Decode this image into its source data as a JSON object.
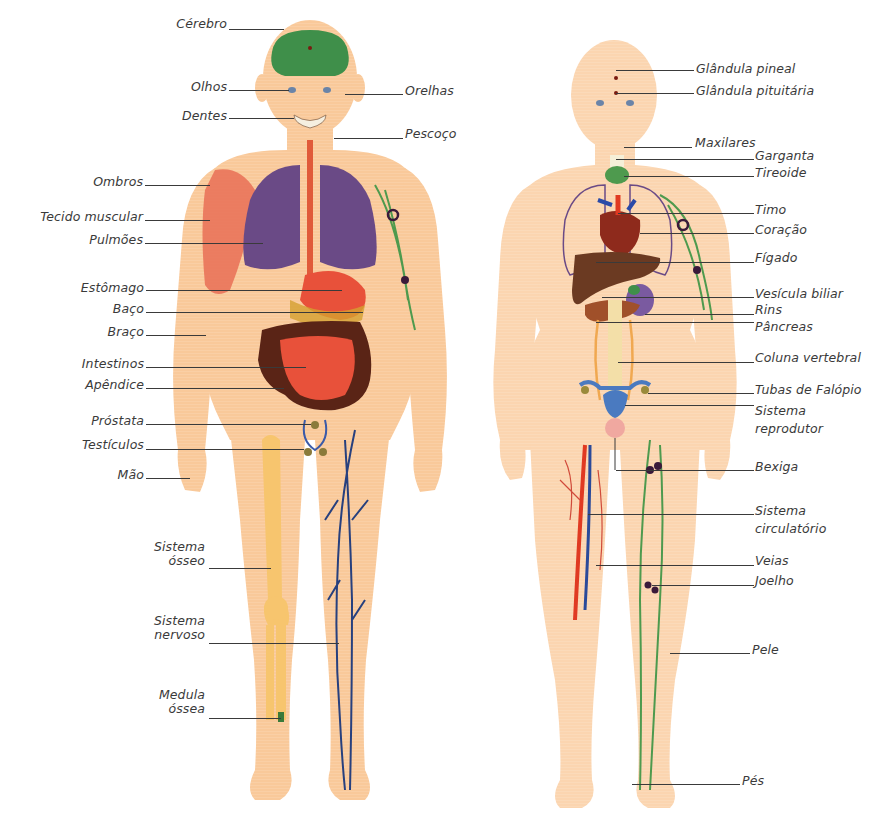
{
  "diagram": {
    "type": "anatomy-illustration",
    "figures": [
      {
        "id": "male",
        "description": "Male human figure, front view, showing organs and systems"
      },
      {
        "id": "female",
        "description": "Female human figure, front view, showing organs and systems"
      }
    ],
    "colors": {
      "skin": "#f9c99a",
      "skin_light": "#fde3c8",
      "brain": "#3f8f4a",
      "lungs": "#6a4a86",
      "stomach": "#e8513a",
      "intestine_dark": "#5a2416",
      "muscle": "#e9735a",
      "bone": "#f7c56e",
      "nerves": "#27407e",
      "lymph": "#4e9a4e",
      "liver": "#6b3a22",
      "heart": "#8e2a1c",
      "artery": "#e03a22",
      "vein": "#2a4a9a",
      "leader_line": "#3a3a3a"
    }
  },
  "male_labels": [
    {
      "text": "Cérebro"
    },
    {
      "text": "Olhos"
    },
    {
      "text": "Dentes"
    },
    {
      "text": "Ombros"
    },
    {
      "text": "Tecido muscular"
    },
    {
      "text": "Pulmões"
    },
    {
      "text": "Estômago"
    },
    {
      "text": "Baço"
    },
    {
      "text": "Braço"
    },
    {
      "text": "Intestinos"
    },
    {
      "text": "Apêndice"
    },
    {
      "text": "Próstata"
    },
    {
      "text": "Testículos"
    },
    {
      "text": "Mão"
    },
    {
      "text": "Sistema",
      "text2": "ósseo"
    },
    {
      "text": "Sistema",
      "text2": "nervoso"
    },
    {
      "text": "Medula",
      "text2": "óssea"
    }
  ],
  "male_right_labels": [
    {
      "text": "Orelhas"
    },
    {
      "text": "Pescoço"
    }
  ],
  "female_labels": [
    {
      "text": "Glândula pineal"
    },
    {
      "text": "Glândula pituitária"
    },
    {
      "text": "Maxilares"
    },
    {
      "text": "Garganta"
    },
    {
      "text": "Tireoide"
    },
    {
      "text": "Timo"
    },
    {
      "text": "Coração"
    },
    {
      "text": "Fígado"
    },
    {
      "text": "Vesícula biliar"
    },
    {
      "text": "Rins"
    },
    {
      "text": "Pâncreas"
    },
    {
      "text": "Coluna vertebral"
    },
    {
      "text": "Tubas de Falópio"
    },
    {
      "text": "Sistema",
      "text2": "reprodutor"
    },
    {
      "text": "Bexiga"
    },
    {
      "text": "Sistema",
      "text2": "circulatório"
    },
    {
      "text": "Veias"
    },
    {
      "text": "Joelho"
    },
    {
      "text": "Pele"
    },
    {
      "text": "Pés"
    }
  ]
}
